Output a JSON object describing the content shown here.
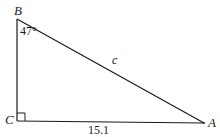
{
  "diagram": {
    "type": "right-triangle",
    "vertices": {
      "A": {
        "label": "A",
        "x": 204,
        "y": 123
      },
      "B": {
        "label": "B",
        "x": 17,
        "y": 19
      },
      "C": {
        "label": "C",
        "x": 17,
        "y": 121
      }
    },
    "angle_B": "47°",
    "side_c_label": "c",
    "side_CA_length": "15.1",
    "right_angle_at": "C",
    "stroke_color": "#1a1a1a",
    "background": "#ffffff"
  }
}
